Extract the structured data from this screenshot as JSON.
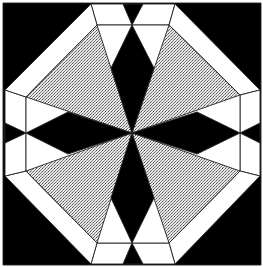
{
  "colors": {
    "background": "#000000",
    "light": "#ffffff",
    "stipple": "#c8c8c8",
    "dark": "#000000",
    "line": "#222222"
  },
  "pattern": {
    "outer_shape": "octagon",
    "inner_shape": "octagon",
    "center_motif": "four-point black star with stippled triangles",
    "piece_counts": {
      "black_corner_triangles": 4,
      "black_edge_notches": 8,
      "white_border_trapezoids": 8,
      "black_star_arms": 4,
      "stippled_triangles": 4
    }
  }
}
